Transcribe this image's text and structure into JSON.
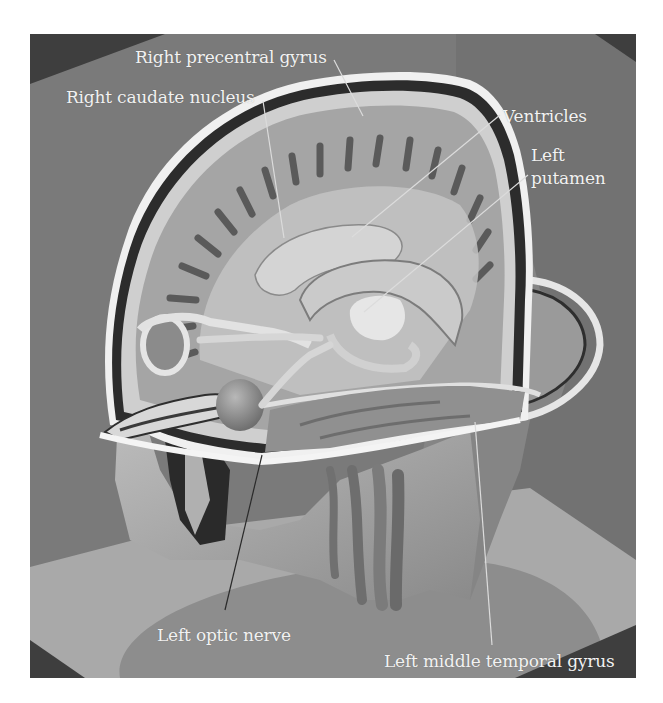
{
  "figure": {
    "colors": {
      "background": "#7a7a7a",
      "dark_corner": "#3e3e3e",
      "floor_light": "#a9a9a9",
      "floor_shadow": "#8d8d8d",
      "label_text": "#f2f2f2",
      "leader_line": "#dcdcdc"
    },
    "labels": [
      {
        "id": "right-precentral-gyrus",
        "text": "Right precentral gyrus"
      },
      {
        "id": "right-caudate-nucleus",
        "text": "Right caudate nucleus"
      },
      {
        "id": "ventricles",
        "text": "Ventricles"
      },
      {
        "id": "left-putamen",
        "line1": "Left",
        "line2": "putamen"
      },
      {
        "id": "left-optic-nerve",
        "text": "Left optic nerve"
      },
      {
        "id": "left-middle-temporal-gyrus",
        "text": "Left middle temporal gyrus"
      }
    ]
  }
}
